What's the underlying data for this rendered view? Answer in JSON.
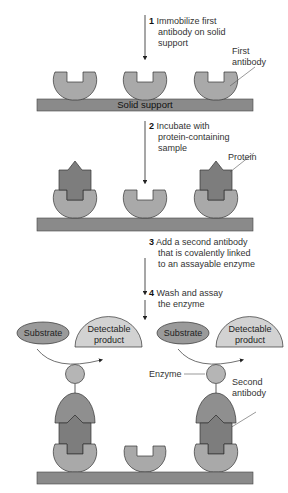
{
  "diagram": {
    "steps": [
      {
        "number": "1",
        "lines": [
          "Immobilize first",
          "antibody on solid",
          "support"
        ]
      },
      {
        "number": "2",
        "lines": [
          "Incubate with",
          "protein-containing",
          "sample"
        ]
      },
      {
        "number": "3",
        "lines": [
          "Add a second antibody",
          "that is covalently linked",
          "to an assayable enzyme"
        ]
      },
      {
        "number": "4",
        "lines": [
          "Wash and assay",
          "the enzyme"
        ]
      }
    ],
    "labels": {
      "first_antibody": [
        "First",
        "antibody"
      ],
      "solid_support": "Solid support",
      "protein": "Protein",
      "substrate": "Substrate",
      "detectable_product": [
        "Detectable",
        "product"
      ],
      "enzyme": "Enzyme",
      "second_antibody": [
        "Second",
        "antibody"
      ]
    },
    "colors": {
      "support": "#8a8a8a",
      "antibody": "#a9a9a9",
      "protein": "#7d7d7d",
      "second_antibody": "#8f8f8f",
      "enzyme": "#b5b5b5",
      "substrate": "#9a9a9a",
      "product": "#d2d2d2",
      "outline": "#2a2a2a"
    }
  }
}
